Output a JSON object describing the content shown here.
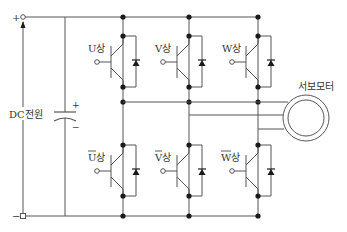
{
  "diagram": {
    "source_label": "DC전원",
    "terminal_plus": "+",
    "terminal_minus": "−",
    "capacitor_plus": "+",
    "capacitor_minus": "−",
    "motor_label": "서보모터",
    "upper_switches": [
      {
        "label": "U상"
      },
      {
        "label": "V상"
      },
      {
        "label": "W상"
      }
    ],
    "lower_switches": [
      {
        "label": "U상",
        "overline_char": "U"
      },
      {
        "label": "V상",
        "overline_char": "V"
      },
      {
        "label": "W상",
        "overline_char": "W"
      }
    ],
    "colors": {
      "wire": "#555555",
      "node": "#1a1a1a",
      "text": "#333333"
    }
  }
}
